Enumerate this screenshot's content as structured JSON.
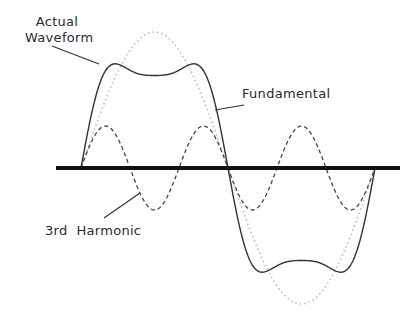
{
  "diagram": {
    "title": "",
    "labels": {
      "actual_line1": "Actual",
      "actual_line2": "Waveform",
      "fundamental": "Fundamental",
      "third_harmonic": "3rd  Harmonic"
    },
    "geometry": {
      "axis": {
        "x1": 56,
        "x2": 400,
        "y": 168
      },
      "wave_start_x": 81,
      "wave_end_x": 375,
      "fundamental_amplitude": 136,
      "harmonic_amplitude": 42
    },
    "colors": {
      "axis": "#111111",
      "actual": "#333333",
      "harmonic": "#444444",
      "fundamental": "#bbbbbb",
      "text": "#2a2a2a"
    }
  }
}
